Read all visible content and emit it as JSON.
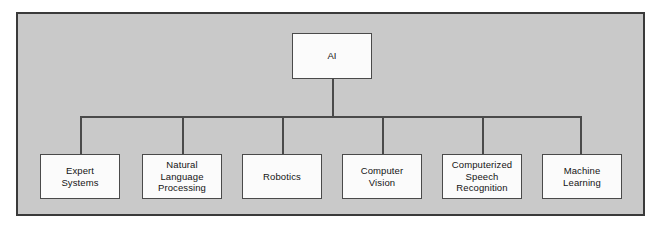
{
  "diagram": {
    "type": "hierarchy-tree",
    "title": "AI",
    "panel": {
      "background_color": "#c9c9c9",
      "border_color": "#3a3a3a"
    },
    "node_style": {
      "fill_color": "#fbfbfb",
      "border_color": "#4a4a4a",
      "text_color": "#141414"
    },
    "root": {
      "label": "AI",
      "x": 290,
      "y": 31,
      "width": 80,
      "height": 46
    },
    "children": [
      {
        "label": "Expert\nSystems",
        "x": 38,
        "y": 152,
        "width": 80,
        "height": 45,
        "connector_x": 78
      },
      {
        "label": "Natural\nLanguage\nProcessing",
        "x": 140,
        "y": 152,
        "width": 80,
        "height": 45,
        "connector_x": 180
      },
      {
        "label": "Robotics",
        "x": 240,
        "y": 152,
        "width": 80,
        "height": 45,
        "connector_x": 280
      },
      {
        "label": "Computer\nVision",
        "x": 340,
        "y": 152,
        "width": 80,
        "height": 45,
        "connector_x": 380
      },
      {
        "label": "Computerized\nSpeech\nRecognition",
        "x": 440,
        "y": 152,
        "width": 80,
        "height": 45,
        "connector_x": 480
      },
      {
        "label": "Machine\nLearning",
        "x": 540,
        "y": 152,
        "width": 80,
        "height": 45,
        "connector_x": 578
      }
    ],
    "connectors": {
      "root_stem_x": 330,
      "root_stem_top": 77,
      "bus_y": 114,
      "bus_left": 78,
      "bus_right": 578,
      "drop_bottom": 152
    }
  }
}
